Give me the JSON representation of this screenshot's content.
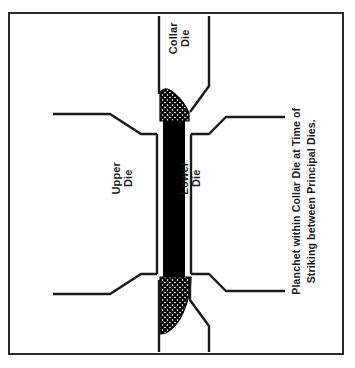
{
  "figure": {
    "title_caption_line1": "Planchet within Collar Die at Time of",
    "title_caption_line2": "Striking between Principal Dies.",
    "labels": {
      "collar_die_line1": "Collar",
      "collar_die_line2": "Die",
      "upper_die_line1": "Upper",
      "upper_die_line2": "Die",
      "lower_die_line1": "Lower",
      "lower_die_line2": "Die"
    },
    "colors": {
      "ink": "#1a1a1a",
      "frame": "#2b2b2b",
      "planchet_fill": "#000000",
      "page_background": "#ffffff",
      "hatch_fill": "#000000"
    },
    "orientation_note": "Diagram and labels rendered rotated 90 degrees.",
    "elements": [
      "collar-die-channel",
      "upper-die-body",
      "lower-die-body",
      "planchet-bar",
      "upper-hatched-metal-flow",
      "lower-hatched-metal-flow",
      "border-frame"
    ]
  }
}
